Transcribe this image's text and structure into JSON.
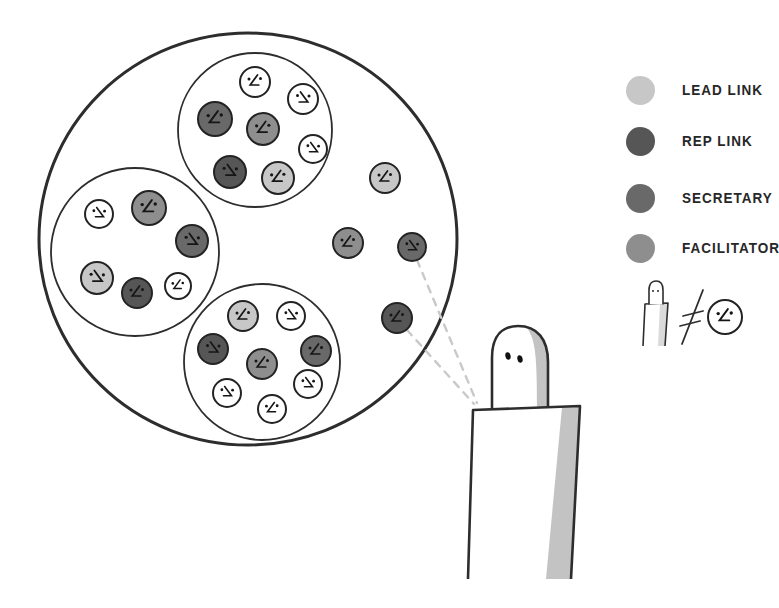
{
  "colors": {
    "ink": "#2d2d2d",
    "lead": "#c7c7c7",
    "rep": "#565656",
    "secretary": "#696969",
    "facilitator": "#8e8e8e",
    "member": "#ffffff",
    "shade": "#c3c3c3",
    "dash": "#c9c9c9",
    "background": "#ffffff"
  },
  "legend": {
    "items": [
      {
        "label": "LEAD LINK",
        "role": "lead"
      },
      {
        "label": "REP LINK",
        "role": "rep"
      },
      {
        "label": "SECRETARY",
        "role": "secretary"
      },
      {
        "label": "FACILITATOR",
        "role": "facilitator"
      }
    ],
    "note_icon": "person-not-equal-role"
  },
  "diagram": {
    "outer_circle": {
      "cx": 248,
      "cy": 239,
      "rx": 209,
      "ry": 206
    },
    "sub_circles": [
      {
        "name": "sub-circle-top",
        "cx": 255,
        "cy": 130,
        "r": 77
      },
      {
        "name": "sub-circle-left",
        "cx": 135,
        "cy": 252,
        "r": 84
      },
      {
        "name": "sub-circle-bottom",
        "cx": 262,
        "cy": 362,
        "r": 78
      }
    ],
    "faces": [
      {
        "cx": 255,
        "cy": 82,
        "r": 15,
        "role": "member",
        "flip": false
      },
      {
        "cx": 303,
        "cy": 99,
        "r": 15,
        "role": "member",
        "flip": true
      },
      {
        "cx": 215,
        "cy": 119,
        "r": 17,
        "role": "secretary",
        "flip": false
      },
      {
        "cx": 263,
        "cy": 129,
        "r": 16,
        "role": "facilitator",
        "flip": false
      },
      {
        "cx": 313,
        "cy": 149,
        "r": 14,
        "role": "member",
        "flip": true
      },
      {
        "cx": 230,
        "cy": 172,
        "r": 16,
        "role": "rep",
        "flip": true
      },
      {
        "cx": 278,
        "cy": 178,
        "r": 16,
        "role": "lead",
        "flip": false
      },
      {
        "cx": 99,
        "cy": 214,
        "r": 14,
        "role": "member",
        "flip": true
      },
      {
        "cx": 149,
        "cy": 208,
        "r": 17,
        "role": "facilitator",
        "flip": false
      },
      {
        "cx": 192,
        "cy": 241,
        "r": 16,
        "role": "secretary",
        "flip": true
      },
      {
        "cx": 97,
        "cy": 278,
        "r": 16,
        "role": "lead",
        "flip": true
      },
      {
        "cx": 137,
        "cy": 293,
        "r": 15,
        "role": "rep",
        "flip": false
      },
      {
        "cx": 178,
        "cy": 286,
        "r": 13,
        "role": "member",
        "flip": false
      },
      {
        "cx": 243,
        "cy": 316,
        "r": 15,
        "role": "lead",
        "flip": false
      },
      {
        "cx": 291,
        "cy": 316,
        "r": 14,
        "role": "member",
        "flip": true
      },
      {
        "cx": 213,
        "cy": 349,
        "r": 15,
        "role": "rep",
        "flip": true
      },
      {
        "cx": 262,
        "cy": 364,
        "r": 15,
        "role": "facilitator",
        "flip": false
      },
      {
        "cx": 316,
        "cy": 351,
        "r": 15,
        "role": "secretary",
        "flip": false
      },
      {
        "cx": 227,
        "cy": 393,
        "r": 14,
        "role": "member",
        "flip": true
      },
      {
        "cx": 308,
        "cy": 384,
        "r": 14,
        "role": "member",
        "flip": true
      },
      {
        "cx": 272,
        "cy": 409,
        "r": 14,
        "role": "member",
        "flip": false
      },
      {
        "cx": 385,
        "cy": 178,
        "r": 15,
        "role": "lead",
        "flip": false
      },
      {
        "cx": 348,
        "cy": 243,
        "r": 15,
        "role": "facilitator",
        "flip": false
      },
      {
        "cx": 412,
        "cy": 247,
        "r": 14,
        "role": "secretary",
        "flip": true
      },
      {
        "cx": 397,
        "cy": 318,
        "r": 15,
        "role": "rep",
        "flip": false
      }
    ],
    "role_links": [
      {
        "from": [
          417,
          260
        ],
        "to": [
          477,
          403
        ]
      },
      {
        "from": [
          407,
          330
        ],
        "to": [
          474,
          404
        ]
      }
    ],
    "person": {
      "head_outline": "M492,411 L492,358 C492,334 504,326 518,326 C537,326 548,339 548,362 L548,409",
      "head_shade": "M548,409 L548,362 C548,344 540,332 527,328 C536,340 537,360 537,409 Z",
      "eyes": [
        {
          "cx": 508,
          "cy": 356
        },
        {
          "cx": 520,
          "cy": 359
        }
      ],
      "body_points": "468,579 473,410 580,406 571,579",
      "body_shade": "562,407 580,406 571,579 546,579"
    },
    "note_icon": {
      "head": "M649,304 L649,290 C649,283 653,281 656,281 C660,281 663,284 663,290 L663,304",
      "eyes": [
        {
          "cx": 653,
          "cy": 291
        },
        {
          "cx": 658,
          "cy": 291
        }
      ],
      "body_points": "643,346 645,304 668,303 665,346",
      "body_shade": "660,304 668,303 665,346 658,346",
      "neq_slash": [
        703,
        290,
        682,
        344
      ],
      "neq_bar1": [
        683,
        316,
        703,
        311
      ],
      "neq_bar2": [
        680,
        326,
        700,
        321
      ],
      "face": {
        "cx": 725,
        "cy": 317,
        "r": 17,
        "flip": false
      }
    }
  }
}
